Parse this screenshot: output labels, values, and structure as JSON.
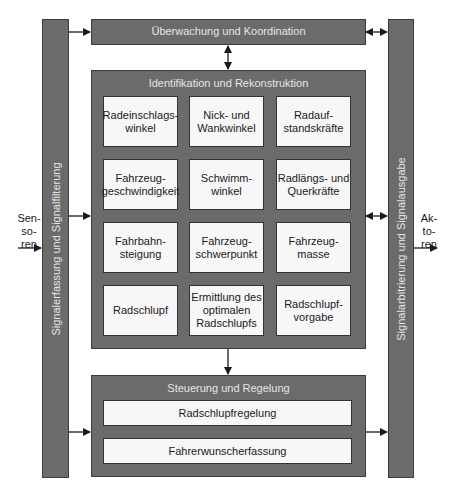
{
  "diagram": {
    "left_bar": {
      "label": "Signalerfassung und Signalfilterung"
    },
    "right_bar": {
      "label": "Signalarbitrierung und Signalausgabe"
    },
    "inputs": {
      "label": "Sen-\nso-\nren"
    },
    "outputs": {
      "label": "Ak-\nto-\nren"
    },
    "top_block": {
      "title": "Überwachung und Koordination"
    },
    "middle_block": {
      "title": "Identifikation und Rekonstruktion",
      "cells": [
        {
          "label": "Radeinschlags-\nwinkel"
        },
        {
          "label": "Nick- und\nWankwinkel"
        },
        {
          "label": "Radauf-\nstandskräfte"
        },
        {
          "label": "Fahrzeug-\ngeschwindigkeit"
        },
        {
          "label": "Schwimm-\nwinkel"
        },
        {
          "label": "Radlängs- und\nQuerkräfte"
        },
        {
          "label": "Fahrbahn-\nsteigung"
        },
        {
          "label": "Fahrzeug-\nschwerpunkt"
        },
        {
          "label": "Fahrzeug-\nmasse"
        },
        {
          "label": "Radschlupf"
        },
        {
          "label": "Ermittlung des\noptimalen\nRadschlupfs"
        },
        {
          "label": "Radschlupf-\nvorgabe"
        }
      ]
    },
    "bottom_block": {
      "title": "Steuerung und Regelung",
      "items": [
        {
          "label": "Radschlupfregelung"
        },
        {
          "label": "Fahrerwunscherfassung"
        }
      ]
    },
    "colors": {
      "block_fill": "#6b6b6b",
      "cell_fill": "#f7f7f7",
      "title_text": "#e6e6e6",
      "line": "#1a1a1a"
    }
  }
}
